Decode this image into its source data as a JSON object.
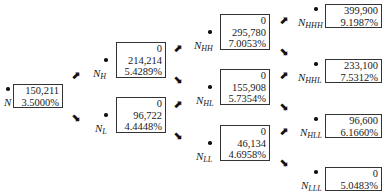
{
  "diagram": {
    "type": "binomial-tree",
    "nodes": [
      {
        "id": "N",
        "label": "N",
        "subscript": "",
        "lines": [
          "150,211",
          "3.5000%"
        ]
      },
      {
        "id": "NH",
        "label": "N",
        "subscript": "H",
        "lines": [
          "0",
          "214,214",
          "5.4289%"
        ]
      },
      {
        "id": "NL",
        "label": "N",
        "subscript": "L",
        "lines": [
          "0",
          "96,722",
          "4.4448%"
        ]
      },
      {
        "id": "NHH",
        "label": "N",
        "subscript": "HH",
        "lines": [
          "0",
          "295,780",
          "7.0053%"
        ]
      },
      {
        "id": "NHL",
        "label": "N",
        "subscript": "HL",
        "lines": [
          "0",
          "155,908",
          "5.7354%"
        ]
      },
      {
        "id": "NLL",
        "label": "N",
        "subscript": "LL",
        "lines": [
          "0",
          "46,134",
          "4.6958%"
        ]
      },
      {
        "id": "NHHH",
        "label": "N",
        "subscript": "HHH",
        "lines": [
          "399,900",
          "9.1987%"
        ]
      },
      {
        "id": "NHHL",
        "label": "N",
        "subscript": "HHL",
        "lines": [
          "233,100",
          "7.5312%"
        ]
      },
      {
        "id": "NHLL",
        "label": "N",
        "subscript": "HLL",
        "lines": [
          "96,600",
          "6.1660%"
        ]
      },
      {
        "id": "NLLL",
        "label": "N",
        "subscript": "LLL",
        "lines": [
          "0",
          "5.0483%"
        ]
      }
    ],
    "arrows": {
      "up": "⬈",
      "down": "⬊"
    }
  }
}
